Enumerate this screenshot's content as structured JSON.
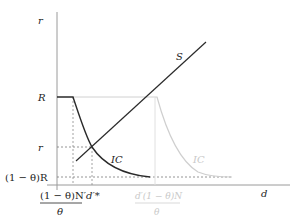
{
  "diagram": {
    "axes": {
      "y_label": "r",
      "x_label": "d"
    },
    "y_ticks": {
      "R": "R",
      "r": "r",
      "one_minus_theta_R": "(1 − θ)R"
    },
    "x_ticks": {
      "frac_left_num": "(1 − θ)N′",
      "frac_left_den": "θ",
      "d_star": "d′*",
      "frac_right_num": "d′(1 − θ)N",
      "frac_right_den": "θ"
    },
    "curves": {
      "supply": "S",
      "ic_dark": "IC",
      "ic_light": "IC"
    },
    "colors": {
      "axis": "#9a9a9a",
      "curve_dark": "#2a2a2a",
      "curve_light": "#cfcfcf",
      "dashed": "#7a7a7a"
    }
  }
}
